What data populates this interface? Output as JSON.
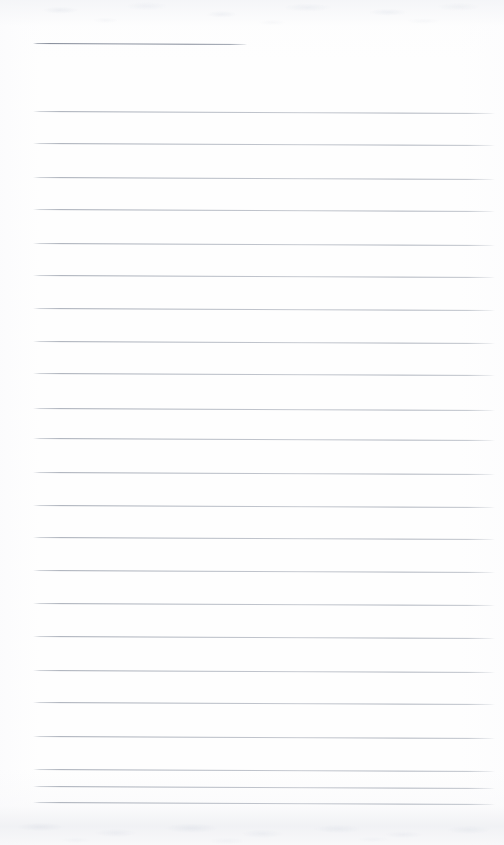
{
  "document": {
    "kind": "scanned-lined-paper",
    "title_line_label": "title rule",
    "body_line_label": "ruled writing line",
    "page_width": 504,
    "page_height": 845,
    "background_color": "#fefefe",
    "rule_color": "#a8aeb9",
    "header_rule_color": "#868d9b",
    "written_text": "",
    "note": "blank ruled sheet — no handwriting or printed text present"
  },
  "geometry": {
    "left_margin_x": 33,
    "right_end_x": 495,
    "header_rule": {
      "y": 43,
      "x_start": 33,
      "x_end": 247,
      "slant_px": 1
    },
    "line_spacing": 32.7,
    "first_body_line_y": 111,
    "last_body_line_y": 802,
    "body_line_count": 23,
    "slant_px_over_width": 2
  },
  "lines": [
    {
      "id": "title-rule",
      "y": 43,
      "x": 33,
      "width": 214,
      "header": true,
      "slant": 1
    },
    {
      "id": "line-01",
      "y": 111,
      "x": 33,
      "width": 462,
      "header": false,
      "slant": 2
    },
    {
      "id": "line-02",
      "y": 143,
      "x": 33,
      "width": 462,
      "header": false,
      "slant": 2
    },
    {
      "id": "line-03",
      "y": 177,
      "x": 33,
      "width": 462,
      "header": false,
      "slant": 2
    },
    {
      "id": "line-04",
      "y": 209,
      "x": 33,
      "width": 462,
      "header": false,
      "slant": 2
    },
    {
      "id": "line-05",
      "y": 243,
      "x": 33,
      "width": 462,
      "header": false,
      "slant": 2
    },
    {
      "id": "line-06",
      "y": 275,
      "x": 33,
      "width": 462,
      "header": false,
      "slant": 2
    },
    {
      "id": "line-07",
      "y": 308,
      "x": 33,
      "width": 462,
      "header": false,
      "slant": 2
    },
    {
      "id": "line-08",
      "y": 341,
      "x": 33,
      "width": 462,
      "header": false,
      "slant": 2
    },
    {
      "id": "line-09",
      "y": 373,
      "x": 33,
      "width": 462,
      "header": false,
      "slant": 2
    },
    {
      "id": "line-10",
      "y": 408,
      "x": 33,
      "width": 462,
      "header": false,
      "slant": 2
    },
    {
      "id": "line-11",
      "y": 438,
      "x": 33,
      "width": 462,
      "header": false,
      "slant": 2
    },
    {
      "id": "line-12",
      "y": 472,
      "x": 33,
      "width": 462,
      "header": false,
      "slant": 2
    },
    {
      "id": "line-13",
      "y": 505,
      "x": 33,
      "width": 462,
      "header": false,
      "slant": 2
    },
    {
      "id": "line-14",
      "y": 537,
      "x": 33,
      "width": 462,
      "header": false,
      "slant": 2
    },
    {
      "id": "line-15",
      "y": 570,
      "x": 33,
      "width": 462,
      "header": false,
      "slant": 2
    },
    {
      "id": "line-16",
      "y": 603,
      "x": 33,
      "width": 462,
      "header": false,
      "slant": 2
    },
    {
      "id": "line-17",
      "y": 636,
      "x": 33,
      "width": 462,
      "header": false,
      "slant": 2
    },
    {
      "id": "line-18",
      "y": 670,
      "x": 33,
      "width": 462,
      "header": false,
      "slant": 2
    },
    {
      "id": "line-19",
      "y": 702,
      "x": 33,
      "width": 462,
      "header": false,
      "slant": 2
    },
    {
      "id": "line-20",
      "y": 736,
      "x": 33,
      "width": 462,
      "header": false,
      "slant": 2
    },
    {
      "id": "line-21",
      "y": 769,
      "x": 33,
      "width": 462,
      "header": false,
      "slant": 2
    },
    {
      "id": "line-22",
      "y": 786,
      "x": 33,
      "width": 462,
      "header": false,
      "slant": 2
    },
    {
      "id": "line-23",
      "y": 802,
      "x": 33,
      "width": 462,
      "header": false,
      "slant": 2
    }
  ]
}
